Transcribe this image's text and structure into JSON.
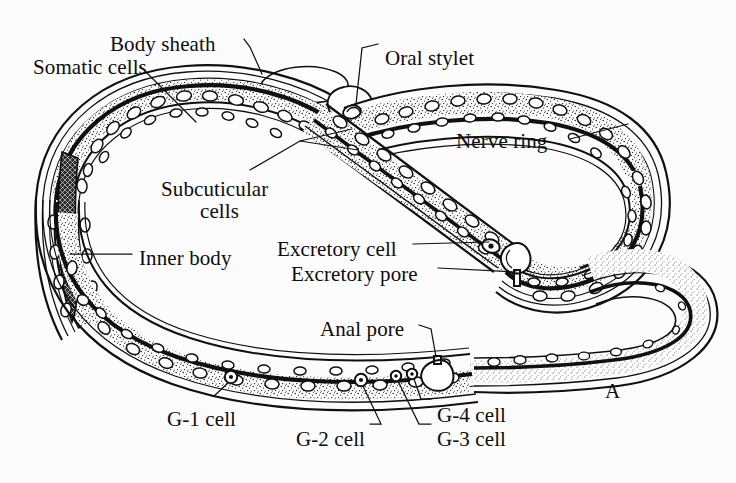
{
  "figure": {
    "panel_letter": "A",
    "organism": "nematode",
    "view": "whole body, coiled, longitudinal section",
    "background_color": "#fcfcfc",
    "ink_color": "#0d0d0d"
  },
  "labels": [
    {
      "id": "body-sheath",
      "text": "Body sheath",
      "x": 110,
      "y": 33,
      "align": "left"
    },
    {
      "id": "somatic-cells",
      "text": "Somatic cells",
      "x": 33,
      "y": 56,
      "align": "left"
    },
    {
      "id": "oral-stylet",
      "text": "Oral stylet",
      "x": 385,
      "y": 47,
      "align": "left"
    },
    {
      "id": "nerve-ring",
      "text": "Nerve ring",
      "x": 456,
      "y": 130,
      "align": "left"
    },
    {
      "id": "subcuticular-cells-line1",
      "text": "Subcuticular",
      "x": 161,
      "y": 178,
      "align": "left"
    },
    {
      "id": "subcuticular-cells-line2",
      "text": "cells",
      "x": 200,
      "y": 200,
      "align": "left"
    },
    {
      "id": "inner-body",
      "text": "Inner body",
      "x": 139,
      "y": 247,
      "align": "left"
    },
    {
      "id": "excretory-cell",
      "text": "Excretory cell",
      "x": 277,
      "y": 238,
      "align": "left"
    },
    {
      "id": "excretory-pore",
      "text": "Excretory pore",
      "x": 291,
      "y": 263,
      "align": "left"
    },
    {
      "id": "anal-pore",
      "text": "Anal pore",
      "x": 320,
      "y": 318,
      "align": "left"
    },
    {
      "id": "g1-cell",
      "text": "G-1 cell",
      "x": 167,
      "y": 408,
      "align": "left"
    },
    {
      "id": "g2-cell",
      "text": "G-2 cell",
      "x": 296,
      "y": 428,
      "align": "left"
    },
    {
      "id": "g3-cell",
      "text": "G-3 cell",
      "x": 437,
      "y": 428,
      "align": "left"
    },
    {
      "id": "g4-cell",
      "text": "G-4 cell",
      "x": 437,
      "y": 404,
      "align": "left"
    }
  ],
  "panel_letter_position": {
    "x": 605,
    "y": 380
  },
  "anatomy_parts": [
    "body sheath",
    "somatic cells",
    "oral stylet",
    "nerve ring",
    "subcuticular cells",
    "inner body",
    "excretory cell",
    "excretory pore",
    "anal pore",
    "G-1 cell",
    "G-2 cell",
    "G-3 cell",
    "G-4 cell"
  ]
}
